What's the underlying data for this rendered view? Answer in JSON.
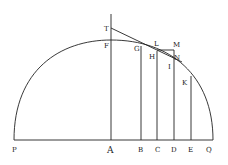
{
  "diagram": {
    "labels": {
      "T": "T",
      "F": "F",
      "G": "G",
      "L": "L",
      "M": "M",
      "H": "H",
      "N": "N",
      "I": "I",
      "K": "K",
      "P": "P",
      "A": "A",
      "B": "B",
      "C": "C",
      "D": "D",
      "E": "E",
      "Q": "Q"
    },
    "colors": {
      "ink": "#222222",
      "background": "#ffffff"
    }
  }
}
